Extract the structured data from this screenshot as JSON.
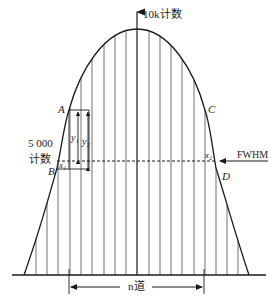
{
  "diagram": {
    "y_axis_label": "10k计数",
    "half_max_label_line1": "5 000",
    "half_max_label_line2": "计数",
    "fwhm_label": "FWHM",
    "width_label": "n道",
    "point_labels": {
      "A": "A",
      "B": "B",
      "C": "C",
      "D": "D"
    },
    "x1_label": "x₁",
    "x2_label": "x₂",
    "y1_label": "y₁",
    "y2_label": "y₂",
    "line_color": "#1a1a1a",
    "peak_counts": 10000,
    "half_max_counts": 5000,
    "channel_lines": 19
  }
}
